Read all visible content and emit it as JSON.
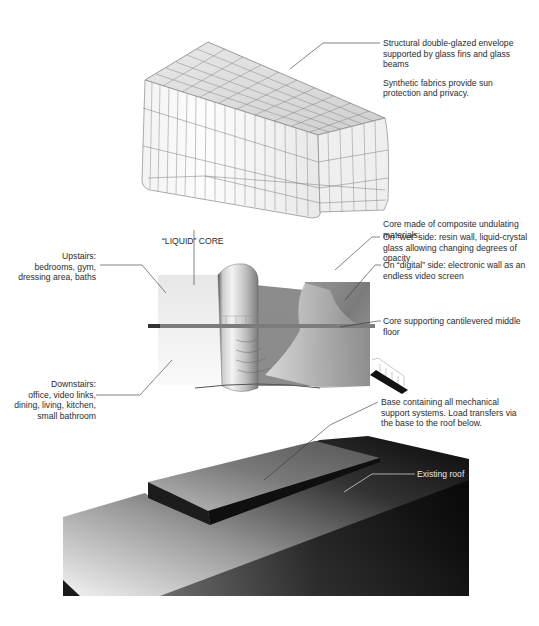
{
  "figure": {
    "sections": [
      {
        "id": "envelope",
        "label": "Glass envelope (wireframe)"
      },
      {
        "id": "core",
        "label": "Interior with liquid core"
      },
      {
        "id": "base",
        "label": "Base on existing roof"
      }
    ]
  },
  "annotations": {
    "envelope": {
      "line1": "Structural double-glazed envelope",
      "line2": "supported by glass fins and glass",
      "line3": "beams",
      "line4": "Synthetic fabrics provide sun",
      "line5": "protection and privacy."
    },
    "core_materials": {
      "line1": "Core made of composite undulating",
      "line2": "materials:"
    },
    "wet_side": {
      "line1": "On “wet” side: resin wall, liquid-crystal",
      "line2": "glass allowing changing degrees of",
      "line3": "opacity"
    },
    "digital_side": {
      "line1": "On “digital” side: electronic wall as an",
      "line2": "endless video screen"
    },
    "core_support": {
      "line1": "Core supporting cantilevered middle",
      "line2": "floor"
    },
    "liquid_core": {
      "label": "“LIQUID” CORE"
    },
    "upstairs": {
      "line1": "Upstairs:",
      "line2": "bedrooms, gym,",
      "line3": "dressing area, baths"
    },
    "downstairs": {
      "line1": "Downstairs:",
      "line2": "office, video links,",
      "line3": "dining, living, kitchen,",
      "line4": "small bathroom"
    },
    "base": {
      "line1": "Base containing all mechanical",
      "line2": "support systems. Load transfers via",
      "line3": "the base to the roof below."
    },
    "existing_roof": {
      "label": "Existing roof"
    }
  },
  "colors": {
    "background": "#ffffff",
    "text": "#2b2b2b",
    "leader": "#333333",
    "roof_dark": "#111111",
    "wire": "#8a8a8a"
  }
}
